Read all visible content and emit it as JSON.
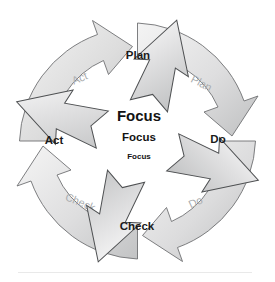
{
  "diagram": {
    "type": "cycle-diagram",
    "center": {
      "labels": [
        {
          "text": "Focus",
          "size": "large"
        },
        {
          "text": "Focus",
          "size": "medium"
        },
        {
          "text": "Focus",
          "size": "small"
        }
      ]
    },
    "background_ring": {
      "description": "outer ring of four curved ghosted arrows flowing clockwise",
      "arrows": [
        {
          "id": "ring-plan",
          "label": "Plan",
          "position": "upper-right",
          "label_x": 201,
          "label_y": 84,
          "rotation": 28
        },
        {
          "id": "ring-do",
          "label": "Do",
          "position": "lower-right",
          "label_x": 196,
          "label_y": 203,
          "rotation": 10
        },
        {
          "id": "ring-check",
          "label": "Check",
          "position": "lower-left",
          "label_x": 80,
          "label_y": 203,
          "rotation": -10
        },
        {
          "id": "ring-act",
          "label": "Act",
          "position": "upper-left",
          "label_x": 80,
          "label_y": 79,
          "rotation": -20
        }
      ]
    },
    "foreground_arrows": [
      {
        "id": "fg-plan",
        "label": "Plan",
        "position": "top",
        "label_x": 138,
        "label_y": 56,
        "angle": 0
      },
      {
        "id": "fg-do",
        "label": "Do",
        "position": "right",
        "label_x": 218,
        "label_y": 140,
        "angle": 90
      },
      {
        "id": "fg-check",
        "label": "Check",
        "position": "bottom",
        "label_x": 137,
        "label_y": 227,
        "angle": 180
      },
      {
        "id": "fg-act",
        "label": "Act",
        "position": "left",
        "label_x": 54,
        "label_y": 141,
        "angle": 270
      }
    ],
    "colors": {
      "arrow_fill_light": "#f2f2f2",
      "arrow_fill_mid": "#dcdcdc",
      "arrow_fill_dark": "#c3c4c5",
      "arrow_stroke": "#5b5d5f",
      "ghost_text": "#a9acae",
      "label_text": "#1b1b1b",
      "background": "#ffffff"
    }
  }
}
